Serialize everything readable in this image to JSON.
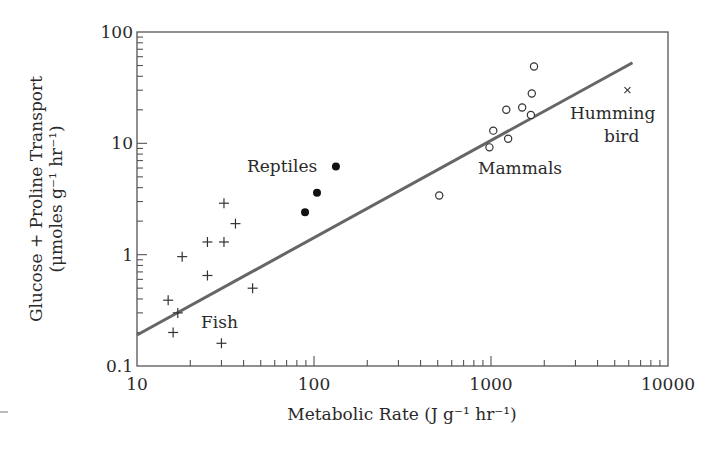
{
  "chart_data": {
    "type": "scatter",
    "title": "",
    "xlabel": "Metabolic Rate (J g⁻¹ hr⁻¹)",
    "ylabel_line1": "Glucose + Proline Transport",
    "ylabel_line2": "(μmoles g⁻¹ hr⁻¹)",
    "xscale": "log",
    "yscale": "log",
    "xlim": [
      10,
      10000
    ],
    "ylim": [
      0.1,
      100
    ],
    "x_ticks": [
      10,
      100,
      1000,
      10000
    ],
    "x_tick_labels": [
      "10",
      "100",
      "1000",
      "10000"
    ],
    "y_ticks": [
      0.1,
      1,
      10,
      100
    ],
    "y_tick_labels": [
      "0.1",
      "1",
      "10",
      "100"
    ],
    "grid": false,
    "legend": null,
    "series": [
      {
        "name": "Fish",
        "marker": "plus",
        "points": [
          [
            31,
            2.9
          ],
          [
            36,
            1.9
          ],
          [
            25,
            1.3
          ],
          [
            31,
            1.3
          ],
          [
            18,
            0.96
          ],
          [
            25,
            0.65
          ],
          [
            45,
            0.5
          ],
          [
            15,
            0.39
          ],
          [
            17,
            0.3
          ],
          [
            16,
            0.2
          ],
          [
            30,
            0.16
          ]
        ]
      },
      {
        "name": "Reptiles",
        "marker": "filled-circle",
        "points": [
          [
            133,
            6.2
          ],
          [
            104,
            3.6
          ],
          [
            89,
            2.4
          ]
        ]
      },
      {
        "name": "Mammals",
        "marker": "open-circle",
        "points": [
          [
            1750,
            49
          ],
          [
            1700,
            28
          ],
          [
            1220,
            20
          ],
          [
            1500,
            21
          ],
          [
            1680,
            18
          ],
          [
            1030,
            13
          ],
          [
            1250,
            11
          ],
          [
            980,
            9.2
          ],
          [
            510,
            3.4
          ]
        ]
      },
      {
        "name": "Humming bird",
        "marker": "x",
        "points": [
          [
            5900,
            30
          ]
        ]
      }
    ],
    "fit_line": {
      "from": [
        10,
        0.19
      ],
      "to": [
        6300,
        53
      ]
    },
    "annotations": [
      {
        "text": "Fish",
        "x": 30,
        "y": 0.22
      },
      {
        "text": "Reptiles",
        "x": 40,
        "y": 6.0
      },
      {
        "text": "Mammals",
        "x": 1000,
        "y": 5.2
      },
      {
        "text": "Humming",
        "x": 2400,
        "y": 16
      },
      {
        "text": "bird",
        "x": 4200,
        "y": 8.5
      }
    ]
  },
  "labels": {
    "fish": "Fish",
    "reptiles": "Reptiles",
    "mammals": "Mammals",
    "humming": "Humming",
    "bird": "bird"
  }
}
